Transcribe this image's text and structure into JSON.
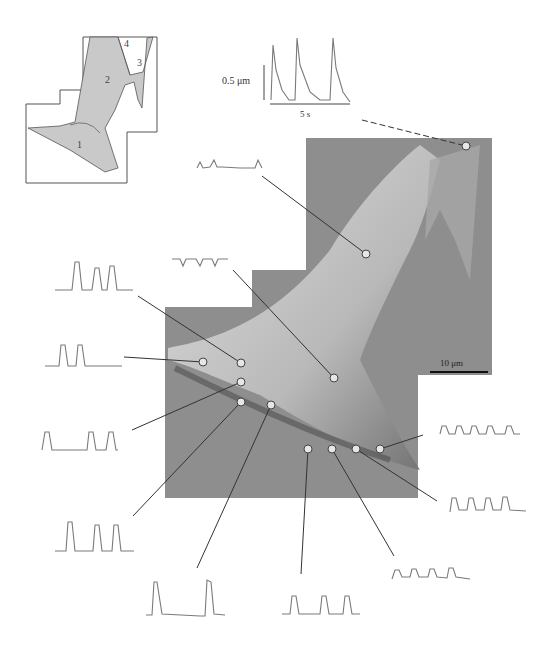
{
  "figure": {
    "type": "AFM cell contractility map with traces",
    "colors": {
      "background": "#ffffff",
      "cell_image": "#8e8e8e",
      "trace": "#7a7a7a",
      "line": "#333333",
      "dot": "#e6e6e6",
      "schematic_fill": "#c9c9c9"
    }
  },
  "schematic": {
    "region_labels": [
      "1",
      "2",
      "3",
      "4"
    ]
  },
  "scale_bar": {
    "trace_vertical": "0.5 μm",
    "trace_horizontal": "5 s",
    "image": "10 μm"
  },
  "probe_points": [
    {
      "id": "top-right",
      "x": 466,
      "y": 146,
      "trace": {
        "x": 258,
        "y": 34,
        "label": "large-peaks-3"
      }
    },
    {
      "id": "upper-mid",
      "x": 366,
      "y": 254,
      "trace": {
        "x": 196,
        "y": 155,
        "label": "irregular-peaks"
      }
    },
    {
      "id": "center",
      "x": 334,
      "y": 378,
      "trace": {
        "x": 172,
        "y": 255,
        "label": "inverted-dips"
      }
    },
    {
      "id": "left-1",
      "x": 241,
      "y": 363,
      "trace": {
        "x": 55,
        "y": 258,
        "label": "peaks-3"
      }
    },
    {
      "id": "left-2",
      "x": 203,
      "y": 362,
      "trace": {
        "x": 45,
        "y": 340,
        "label": "peaks-2"
      }
    },
    {
      "id": "left-3",
      "x": 241,
      "y": 382,
      "trace": {
        "x": 40,
        "y": 430,
        "label": "peaks-3-gap"
      }
    },
    {
      "id": "left-4",
      "x": 241,
      "y": 402,
      "trace": {
        "x": 55,
        "y": 520,
        "label": "peaks-3-wide"
      }
    },
    {
      "id": "mid-low",
      "x": 271,
      "y": 405,
      "trace": {
        "x": 145,
        "y": 575,
        "label": "peaks-2-tall"
      }
    },
    {
      "id": "bottom-1",
      "x": 308,
      "y": 449,
      "trace": {
        "x": 282,
        "y": 593,
        "label": "peaks-3-bottom"
      }
    },
    {
      "id": "bottom-2",
      "x": 332,
      "y": 449,
      "trace": {
        "x": 392,
        "y": 568,
        "label": "peaks-4-small"
      }
    },
    {
      "id": "bottom-3",
      "x": 356,
      "y": 449,
      "trace": {
        "x": 448,
        "y": 497,
        "label": "peaks-5"
      }
    },
    {
      "id": "right",
      "x": 380,
      "y": 449,
      "trace": {
        "x": 440,
        "y": 425,
        "label": "peaks-5-small"
      }
    }
  ]
}
